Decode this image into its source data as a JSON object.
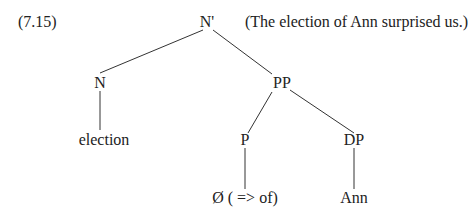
{
  "example_number": "(7.15)",
  "gloss": "(The election of Ann surprised us.)",
  "tree": {
    "root": "N'",
    "n": "N",
    "pp": "PP",
    "p": "P",
    "dp": "DP",
    "n_leaf": "election",
    "p_leaf": "Ø ( => of)",
    "dp_leaf": "Ann"
  }
}
